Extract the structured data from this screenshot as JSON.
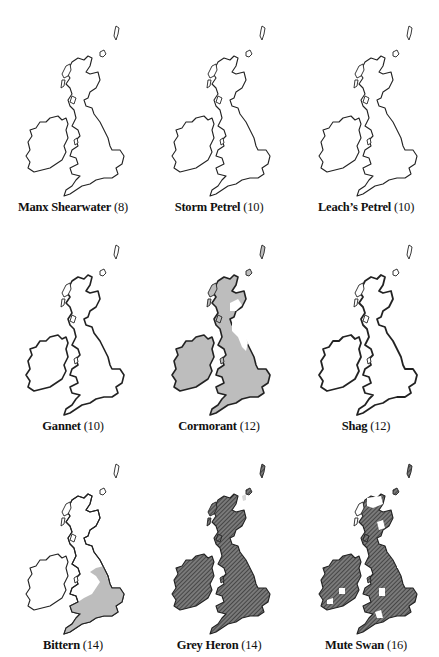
{
  "page": {
    "type": "species distribution map grid",
    "region": "Britain and Ireland"
  },
  "styles": {
    "outline_color": "#222222",
    "grey_fill": "#bdbdbd",
    "hatch_fill": "#6e6e6e",
    "hatch_line": "#2a2a2a",
    "background": "#ffffff"
  },
  "maps": [
    {
      "name": "Manx Shearwater",
      "count": "(8)",
      "fill_style": "outline"
    },
    {
      "name": "Storm Petrel",
      "count": "(10)",
      "fill_style": "outline"
    },
    {
      "name": "Leach’s Petrel",
      "count": "(10)",
      "fill_style": "outline"
    },
    {
      "name": "Gannet",
      "count": "(10)",
      "fill_style": "outline"
    },
    {
      "name": "Cormorant",
      "count": "(12)",
      "fill_style": "grey"
    },
    {
      "name": "Shag",
      "count": "(12)",
      "fill_style": "outline"
    },
    {
      "name": "Bittern",
      "count": "(14)",
      "fill_style": "grey-south"
    },
    {
      "name": "Grey Heron",
      "count": "(14)",
      "fill_style": "hatched"
    },
    {
      "name": "Mute Swan",
      "count": "(16)",
      "fill_style": "hatched-patchy"
    }
  ]
}
